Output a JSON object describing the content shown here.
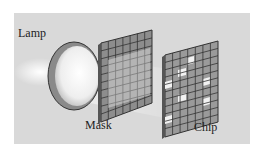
{
  "diagram": {
    "labels": {
      "lamp": "Lamp",
      "mask": "Mask",
      "chip": "Chip"
    },
    "colors": {
      "panel_bg": "#d9d9d9",
      "grid_cell": "#9a9a9a",
      "grid_line": "#3a3a3a",
      "bright_cell": "#f2f2f2",
      "lamp_glow": "#ffffff"
    }
  }
}
